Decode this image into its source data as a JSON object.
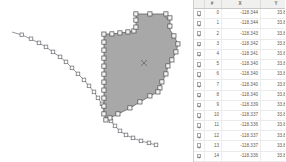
{
  "map": {
    "name": "map-canvas",
    "background_color": "#ffffff",
    "polygon": {
      "name": "selected-polygon",
      "fill_color": "#a8a8a8",
      "stroke_color": "#6e6e6e",
      "vertex_handle_fill": "#f2f2f2",
      "vertex_handle_stroke": "#555555",
      "center_marker": "x"
    },
    "line_feature": {
      "name": "vertex-line-feature",
      "stroke_color": "#8d8d96",
      "vertex_handle_fill": "#fafafa",
      "vertex_handle_stroke": "#6a6a72"
    }
  },
  "table": {
    "name": "vertex-attribute-table",
    "columns": [
      {
        "key": "check",
        "label": ""
      },
      {
        "key": "idx",
        "label": "#"
      },
      {
        "key": "x",
        "label": "X"
      },
      {
        "key": "y",
        "label": "Y"
      }
    ],
    "rows": [
      {
        "checked": true,
        "idx": "0",
        "x": "-118.344",
        "y": "33.885"
      },
      {
        "checked": true,
        "idx": "1",
        "x": "-118.344",
        "y": "33.886"
      },
      {
        "checked": true,
        "idx": "2",
        "x": "-118.343",
        "y": "33.886"
      },
      {
        "checked": true,
        "idx": "3",
        "x": "-118.342",
        "y": "33.886"
      },
      {
        "checked": true,
        "idx": "4",
        "x": "-118.341",
        "y": "33.886"
      },
      {
        "checked": true,
        "idx": "5",
        "x": "-118.340",
        "y": "33.886"
      },
      {
        "checked": true,
        "idx": "6",
        "x": "-118.340",
        "y": "33.886"
      },
      {
        "checked": true,
        "idx": "7",
        "x": "-118.340",
        "y": "33.887"
      },
      {
        "checked": true,
        "idx": "8",
        "x": "-118.340",
        "y": "33.887"
      },
      {
        "checked": true,
        "idx": "9",
        "x": "-118.339",
        "y": "33.887"
      },
      {
        "checked": true,
        "idx": "10",
        "x": "-118.337",
        "y": "33.887"
      },
      {
        "checked": true,
        "idx": "11",
        "x": "-118.336",
        "y": "33.887"
      },
      {
        "checked": true,
        "idx": "12",
        "x": "-118.337",
        "y": "33.887"
      },
      {
        "checked": true,
        "idx": "13",
        "x": "-118.337",
        "y": "33.886"
      },
      {
        "checked": true,
        "idx": "14",
        "x": "-118.336",
        "y": "33.886"
      },
      {
        "checked": true,
        "idx": "15",
        "x": "-118.336",
        "y": "33.885"
      }
    ]
  }
}
